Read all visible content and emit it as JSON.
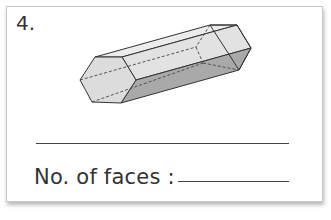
{
  "question": {
    "number": "4.",
    "shape": "hexagonal-prism",
    "prompt_label": "No. of faces :",
    "answer": ""
  }
}
